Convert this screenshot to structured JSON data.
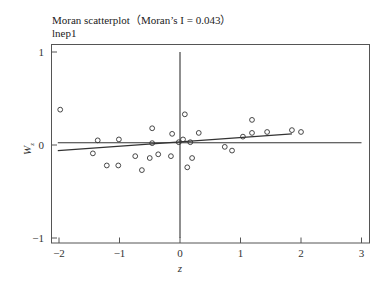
{
  "chart_data": {
    "type": "scatter",
    "title": "Moran scatterplot（Moran’s I = 0.043）",
    "subtitle": "lnep1",
    "xlabel": "z",
    "ylabel": "Wz",
    "xlim": [
      -2.15,
      3.1
    ],
    "ylim": [
      -1.05,
      1.09
    ],
    "xticks": [
      -2,
      -1,
      0,
      1,
      2,
      3
    ],
    "yticks": [
      -1,
      0,
      1
    ],
    "grid": false,
    "legend": "none",
    "points": [
      {
        "x": -1.98,
        "y": 0.38
      },
      {
        "x": -1.36,
        "y": 0.05
      },
      {
        "x": -1.44,
        "y": -0.09
      },
      {
        "x": -1.21,
        "y": -0.22
      },
      {
        "x": -1.02,
        "y": -0.22
      },
      {
        "x": -1.01,
        "y": 0.06
      },
      {
        "x": -0.74,
        "y": -0.12
      },
      {
        "x": -0.63,
        "y": -0.27
      },
      {
        "x": -0.5,
        "y": -0.14
      },
      {
        "x": -0.46,
        "y": 0.18
      },
      {
        "x": -0.46,
        "y": 0.02
      },
      {
        "x": -0.36,
        "y": -0.1
      },
      {
        "x": -0.15,
        "y": -0.12
      },
      {
        "x": -0.13,
        "y": 0.12
      },
      {
        "x": -0.02,
        "y": 0.03
      },
      {
        "x": 0.05,
        "y": 0.06
      },
      {
        "x": 0.08,
        "y": 0.33
      },
      {
        "x": 0.17,
        "y": 0.03
      },
      {
        "x": 0.2,
        "y": -0.14
      },
      {
        "x": 0.12,
        "y": -0.24
      },
      {
        "x": 0.31,
        "y": 0.13
      },
      {
        "x": 0.74,
        "y": -0.02
      },
      {
        "x": 0.86,
        "y": -0.06
      },
      {
        "x": 1.04,
        "y": 0.09
      },
      {
        "x": 1.19,
        "y": 0.27
      },
      {
        "x": 1.19,
        "y": 0.13
      },
      {
        "x": 1.44,
        "y": 0.14
      },
      {
        "x": 1.85,
        "y": 0.16
      },
      {
        "x": 2.0,
        "y": 0.14
      }
    ],
    "lines": [
      {
        "name": "regression-line",
        "x": [
          -2.02,
          1.85
        ],
        "y": [
          -0.06,
          0.12
        ]
      },
      {
        "name": "horizontal-mean-line",
        "x": [
          -2.02,
          3.0
        ],
        "y": [
          0.025,
          0.025
        ]
      },
      {
        "name": "vertical-zero-line",
        "x": [
          0,
          0
        ],
        "y": [
          -1.0,
          1.0
        ]
      }
    ],
    "moran_i": 0.043
  },
  "labels": {
    "title": "Moran scatterplot（Moran’s I = 0.043）",
    "subtitle": "lnep1",
    "xlabel": "z",
    "ylabel_main": "W",
    "ylabel_sub": "z"
  }
}
